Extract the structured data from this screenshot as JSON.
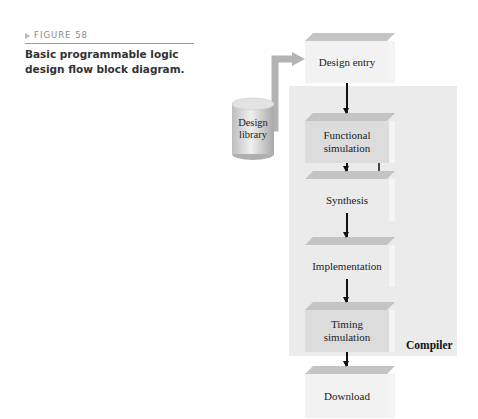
{
  "figure": {
    "label": "FIGURE 58",
    "caption": "Basic programmable logic design flow block diagram."
  },
  "diagram": {
    "library": {
      "line1": "Design",
      "line2": "library"
    },
    "blocks": [
      {
        "id": "design-entry",
        "line1": "Design entry",
        "line2": ""
      },
      {
        "id": "functional-simulation",
        "line1": "Functional",
        "line2": "simulation"
      },
      {
        "id": "synthesis",
        "line1": "Synthesis",
        "line2": ""
      },
      {
        "id": "implementation",
        "line1": "Implementation",
        "line2": ""
      },
      {
        "id": "timing-simulation",
        "line1": "Timing",
        "line2": "simulation"
      },
      {
        "id": "download",
        "line1": "Download",
        "line2": ""
      }
    ],
    "group_label": "Compiler"
  }
}
